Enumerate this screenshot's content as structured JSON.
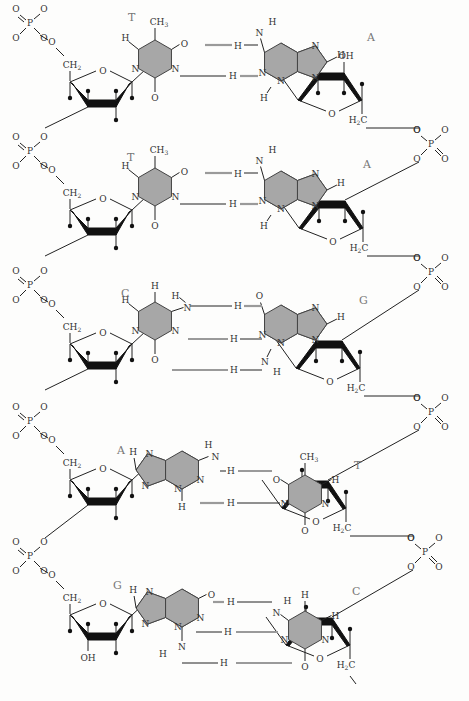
{
  "diagram": {
    "colors": {
      "base_fill": "#a7a7a7",
      "hbond": "#9a9a9a",
      "bond": "#222222",
      "label": "#777777"
    },
    "pairs": [
      {
        "left_base": "T",
        "right_base": "A",
        "left_sub": "CH3",
        "right_sugar_sub": "OH",
        "right_chain": "H2C",
        "hbonds": 2
      },
      {
        "left_base": "T",
        "right_base": "A",
        "left_sub": "CH3",
        "right_chain": "H2C",
        "hbonds": 2
      },
      {
        "left_base": "C",
        "right_base": "G",
        "right_chain": "H2C",
        "hbonds": 3
      },
      {
        "left_base": "A",
        "right_base": "T",
        "right_sub": "CH3",
        "right_chain": "H2C",
        "hbonds": 2
      },
      {
        "left_base": "G",
        "right_base": "C",
        "left_sugar_sub": "OH",
        "right_chain": "H2C",
        "hbonds": 3
      }
    ],
    "atoms": {
      "phosphorus": "P",
      "oxygen": "O",
      "nitrogen": "N",
      "hydrogen": "H",
      "left_chain": "CH2",
      "hydroxyl": "OH",
      "methyl": "CH3"
    }
  }
}
